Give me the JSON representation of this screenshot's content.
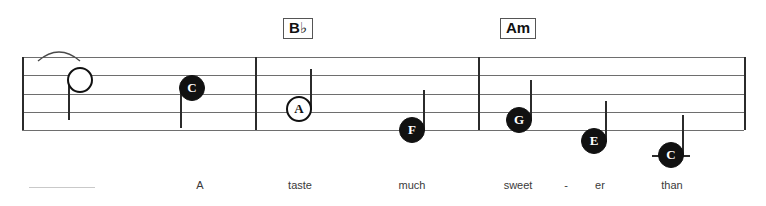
{
  "document": {
    "type": "music-notation-staff",
    "title": "Lead sheet excerpt",
    "staff": {
      "line_count": 5,
      "top_y": 57,
      "bottom_y": 130,
      "left_x": 22,
      "right_x": 744,
      "line_color": "#6e6e6e"
    },
    "barlines": [
      {
        "name": "barline-1",
        "x": 22
      },
      {
        "name": "barline-2",
        "x": 255
      },
      {
        "name": "barline-3",
        "x": 478
      },
      {
        "name": "barline-end",
        "x": 744
      }
    ],
    "chords": [
      {
        "label": "B",
        "accidental": "♭",
        "x": 283,
        "y": 18
      },
      {
        "label": "Am",
        "accidental": "",
        "x": 500,
        "y": 18
      }
    ],
    "notes": [
      {
        "letter": "",
        "style": "plain",
        "x": 80,
        "y": 80,
        "stem": "down",
        "ledger": false
      },
      {
        "letter": "C",
        "style": "filled",
        "x": 192,
        "y": 88,
        "stem": "down",
        "ledger": false
      },
      {
        "letter": "A",
        "style": "hollow",
        "x": 299,
        "y": 109,
        "stem": "up",
        "ledger": false
      },
      {
        "letter": "F",
        "style": "filled",
        "x": 412,
        "y": 130,
        "stem": "up",
        "ledger": false
      },
      {
        "letter": "G",
        "style": "filled",
        "x": 519,
        "y": 120,
        "stem": "up",
        "ledger": false
      },
      {
        "letter": "E",
        "style": "filled",
        "x": 594,
        "y": 141,
        "stem": "up",
        "ledger": false
      },
      {
        "letter": "C",
        "style": "filled",
        "x": 671,
        "y": 155,
        "stem": "up",
        "ledger": true
      }
    ],
    "slur": {
      "name": "tie-slur",
      "x": 36,
      "y": 46,
      "width": 40,
      "height": 12
    },
    "lyrics": [
      {
        "text": "",
        "x": 62,
        "extender": true
      },
      {
        "text": "A",
        "x": 200,
        "extender": false
      },
      {
        "text": "taste",
        "x": 300,
        "extender": false
      },
      {
        "text": "much",
        "x": 412,
        "extender": false
      },
      {
        "text": "sweet",
        "x": 518,
        "extender": false
      },
      {
        "text": "-",
        "x": 566,
        "extender": false
      },
      {
        "text": "er",
        "x": 600,
        "extender": false
      },
      {
        "text": "than",
        "x": 672,
        "extender": false
      }
    ],
    "lyrics_y": 186,
    "colors": {
      "ink": "#111111",
      "staff": "#6e6e6e",
      "lyric": "#3a3a3a",
      "extender": "#c9c9c9",
      "background": "#ffffff"
    }
  }
}
